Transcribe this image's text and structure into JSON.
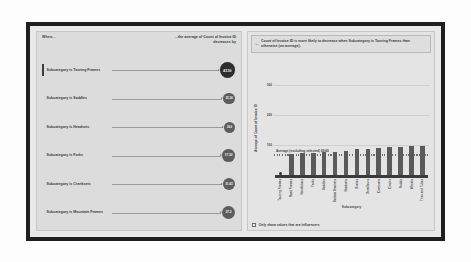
{
  "visual": {
    "type": "key-influencers",
    "left_panel": {
      "header_when": "When...",
      "header_effect": "...the average of Count of Invoice ID decreases by",
      "influencers": [
        {
          "label": "Subcategory is Touring Frames",
          "value": "4110",
          "selected": true,
          "bubble_px": 15.5
        },
        {
          "label": "Subcategory is Saddles",
          "value": "35.24",
          "selected": false,
          "bubble_px": 11.8
        },
        {
          "label": "Subcategory is Headsets",
          "value": "26.9",
          "selected": false,
          "bubble_px": 11.0
        },
        {
          "label": "Subcategory is Forks",
          "value": "17.32",
          "selected": false,
          "bubble_px": 12.6
        },
        {
          "label": "Subcategory is Cranksets",
          "value": "31.43",
          "selected": false,
          "bubble_px": 12.2
        },
        {
          "label": "Subcategory is Mountain Frames",
          "value": "37.2",
          "selected": false,
          "bubble_px": 12.9
        },
        {
          "label": "Subcategory is Bottom Brackets",
          "value": "31.46",
          "selected": false,
          "bubble_px": 12.1
        }
      ]
    },
    "right_panel": {
      "callout_arrow_icon": "left-arrow-icon",
      "callout_text": "Count of Invoice ID is more likely to decrease when Subcategory is Touring Frames than otherwise (on average).",
      "average_caption": "Average (excluding selected) 69.60",
      "footer_checkbox_label": "Only show values that are influencers",
      "footer_checkbox_checked": false
    }
  },
  "chart_data": {
    "type": "bar",
    "title": "",
    "xlabel": "Subcategory",
    "ylabel": "Average of Count of Invoice ID",
    "ylim": [
      0,
      340
    ],
    "yticks": [
      100,
      200,
      300
    ],
    "ytick_labels": [
      "100",
      "200",
      "300"
    ],
    "grid": true,
    "legend": "none",
    "annotations": [
      {
        "type": "reference-line",
        "label": "Average (excluding selected) 69.60",
        "value": 69.6
      }
    ],
    "categories": [
      "Touring Frames",
      "Road Frames",
      "Handlebars",
      "Forks",
      "Saddles",
      "Bottom Brackets",
      "Headsets",
      "Brakes",
      "Derailleurs",
      "Cranksets",
      "Chains",
      "Pedals",
      "Wheels",
      "Tires and Tubes"
    ],
    "values": [
      8,
      70,
      72,
      74,
      76,
      78,
      80,
      86,
      88,
      90,
      92,
      94,
      95,
      96
    ],
    "highlight_index": 0,
    "highlight_color": "#2f2f2f",
    "bar_color": "#5a5a5a"
  }
}
